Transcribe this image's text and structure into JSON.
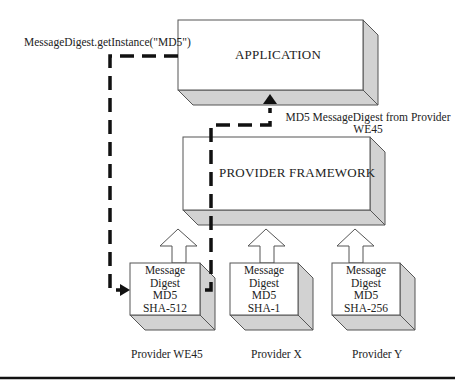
{
  "diagram": {
    "call_label": "MessageDigest.getInstance(\"MD5\")",
    "return_label_line1": "MD5 MessageDigest from Provider",
    "return_label_line2": "WE45",
    "application": {
      "label": "APPLICATION"
    },
    "framework": {
      "label": "PROVIDER FRAMEWORK"
    },
    "providers": [
      {
        "name": "Provider WE45",
        "lines": [
          "Message",
          "Digest",
          "MD5",
          "SHA-512"
        ]
      },
      {
        "name": "Provider X",
        "lines": [
          "Message",
          "Digest",
          "MD5",
          "SHA-1"
        ]
      },
      {
        "name": "Provider Y",
        "lines": [
          "Message",
          "Digest",
          "MD5",
          "SHA-256"
        ]
      }
    ],
    "colors": {
      "face": "#ffffff",
      "side": "#d2d2d2",
      "edge": "#555555",
      "path": "#111111"
    }
  }
}
